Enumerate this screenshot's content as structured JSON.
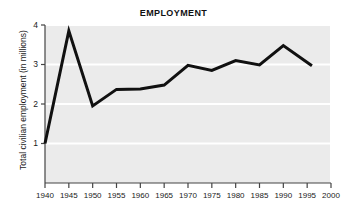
{
  "chart_data": {
    "type": "line",
    "title": "EMPLOYMENT",
    "xlabel": "",
    "ylabel": "Total civilian employment (in millions)",
    "x": [
      1940,
      1945,
      1950,
      1955,
      1960,
      1965,
      1970,
      1975,
      1980,
      1985,
      1990,
      1996
    ],
    "values": [
      1.0,
      3.85,
      1.95,
      2.37,
      2.38,
      2.48,
      2.98,
      2.85,
      3.1,
      2.99,
      3.48,
      2.97
    ],
    "series": [
      {
        "name": "Total civilian employment",
        "values": [
          1.0,
          3.85,
          1.95,
          2.37,
          2.38,
          2.48,
          2.98,
          2.85,
          3.1,
          2.99,
          3.48,
          2.97
        ]
      }
    ],
    "xlim": [
      1940,
      2000
    ],
    "ylim": [
      0,
      4
    ],
    "xticks": [
      1940,
      1945,
      1950,
      1955,
      1960,
      1965,
      1970,
      1975,
      1980,
      1985,
      1990,
      1995,
      2000
    ],
    "xtick_labels": [
      "1940",
      "1945",
      "1950",
      "1955",
      "1960",
      "1965",
      "1970",
      "1975",
      "1980",
      "1985",
      "1990",
      "1995",
      "2000"
    ],
    "yticks": [
      1,
      2,
      3,
      4
    ],
    "ytick_labels": [
      "1",
      "2",
      "3",
      "4"
    ],
    "grid": "horizontal-white",
    "legend": "none",
    "colors": {
      "line": "#111111",
      "plot_background": "#ebebeb",
      "gridline": "#ffffff",
      "axis": "#444444",
      "figure_background": "#ffffff",
      "text": "#1a1a1a"
    },
    "line_width_px": 3
  }
}
